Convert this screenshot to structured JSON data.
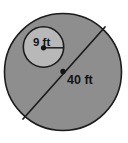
{
  "figure": {
    "background_color": "#ffffff",
    "canvas": {
      "width": 128,
      "height": 143
    }
  },
  "shapes": {
    "outer_circle": {
      "name": "large-circle",
      "center": {
        "x": 63,
        "y": 72
      },
      "radius": 59,
      "fill_color": "#8e8e8e",
      "stroke_color": "#1c1c1c"
    },
    "inner_circle": {
      "name": "small-circle",
      "center": {
        "x": 43.5,
        "y": 47
      },
      "radius": 20.5,
      "fill_color": "#b8b8b8",
      "stroke_color": "#1c1c1c"
    }
  },
  "measurements": {
    "diameter": {
      "label": "40 ft",
      "value": 40,
      "unit": "ft",
      "type": "diameter",
      "line_start": {
        "x": 105,
        "y": 27
      },
      "line_end": {
        "x": 23,
        "y": 119
      },
      "label_position": {
        "x": 67,
        "y": 83
      }
    },
    "radius": {
      "label": "9 ft",
      "value": 9,
      "unit": "ft",
      "type": "radius",
      "line_start": {
        "x": 43.5,
        "y": 47.5
      },
      "line_end": {
        "x": 64,
        "y": 47.5
      },
      "label_position": {
        "x": 34,
        "y": 46
      }
    }
  },
  "center_markers": {
    "outer_dot_label": "large-circle-center-point",
    "inner_dot_label": "small-circle-center-point",
    "color": "#141414"
  }
}
